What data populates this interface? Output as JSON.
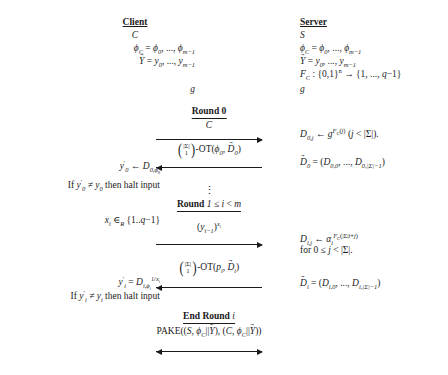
{
  "figure": {
    "type": "protocol-sequence-diagram",
    "background_color": "#ffffff",
    "text_color": "#1a1a1a"
  },
  "columns": {
    "client": {
      "title": "Client",
      "identity": "C",
      "lines": [
        {
          "id": "phi",
          "text": "ϕ_C = ϕ_0, ..., ϕ_{m-1}"
        },
        {
          "id": "yvec",
          "text": "Y⃗ = y_0, ..., y_{m-1}"
        },
        {
          "id": "g",
          "text": "g"
        }
      ]
    },
    "server": {
      "title": "Server",
      "identity": "S",
      "lines": [
        {
          "id": "phi",
          "text": "ϕ_C = ϕ_0, ..., ϕ_{m-1}"
        },
        {
          "id": "yvec",
          "text": "Y⃗ = y_0, ..., y_{m-1}"
        },
        {
          "id": "fc",
          "text": "F_C : {0,1}^n → {1, ..., q-1}"
        },
        {
          "id": "g",
          "text": "g"
        }
      ]
    }
  },
  "rounds": [
    {
      "id": "round-0",
      "label_prefix": "Round 0",
      "label_suffix": "",
      "messages": [
        {
          "id": "msg-c",
          "text": "C",
          "direction": "right"
        },
        {
          "id": "msg-ot0",
          "text": "(|Σ| choose 1)-OT(ϕ_0, D⃗_0)",
          "direction": "left"
        }
      ],
      "client_notes": [
        {
          "id": "note-y0",
          "text": "y'_0 ← D_{0,ϕ_0}"
        },
        {
          "id": "note-halt0",
          "text": "If y'_0 ≠ y_0 then halt input"
        }
      ],
      "server_notes": [
        {
          "id": "note-d0j",
          "text": "D_{0,j} ← g^{F_C(j)} (j < |Σ|)."
        },
        {
          "id": "note-dvec0",
          "text": "D⃗_0 = (D_{0,0}, ..., D_{0,|Σ|-1})"
        }
      ]
    },
    {
      "id": "round-i",
      "label_prefix": "Round",
      "label_suffix": "1 ≤ i < m",
      "messages": [
        {
          "id": "msg-yx",
          "text": "(y_{i-1})^{x_i}",
          "direction": "right"
        },
        {
          "id": "msg-oti",
          "text": "(|Σ| choose 1)-OT(p_i, D⃗_i)",
          "direction": "left"
        }
      ],
      "client_notes": [
        {
          "id": "note-xi",
          "text": "x_i ∈_R {1..q-1}"
        },
        {
          "id": "note-yi",
          "text": "y'_i = D_{i,ϕ_i}^{1/x_i}"
        },
        {
          "id": "note-halti",
          "text": "If y'_i ≠ y_i then halt input"
        }
      ],
      "server_notes": [
        {
          "id": "note-dij",
          "text": "D_{i,j} ← α_i^{F_C(|Σ|i+j)}"
        },
        {
          "id": "note-dij2",
          "text": "for 0 ≤ j < |Σ|."
        },
        {
          "id": "note-dveci",
          "text": "D⃗_i = (D_{i,0}, ..., D_{i,|Σ|-1})"
        }
      ]
    },
    {
      "id": "end-round",
      "label_prefix": "End Round",
      "label_suffix": "i",
      "messages": [
        {
          "id": "msg-pake",
          "text": "PAKE((S, ϕ_C||Y⃗), (C, ϕ_C||Y⃗))",
          "direction": "both"
        }
      ],
      "client_notes": [],
      "server_notes": []
    }
  ],
  "symbols": {
    "vdots": "⋮",
    "sigma": "Σ",
    "phi": "ϕ",
    "alpha": "α",
    "leftarrow": "←",
    "rightarrow": "→",
    "neq": "≠",
    "leq": "≤",
    "in_r": "∈",
    "parallel": "||"
  }
}
